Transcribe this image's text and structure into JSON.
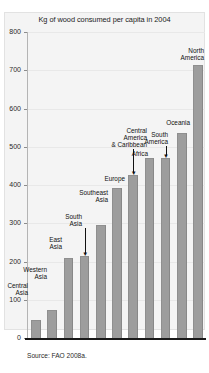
{
  "chart_data": {
    "type": "bar",
    "title": "Kg of wood consumed per capita in 2004",
    "xlabel": "",
    "ylabel": "",
    "ylim": [
      0,
      800
    ],
    "yticks": [
      0,
      100,
      200,
      300,
      400,
      500,
      600,
      700,
      800
    ],
    "grid": true,
    "legend": "none",
    "source": "Source: FAO 2008a.",
    "bar_color": "#9d9d9d",
    "categories": [
      "Central Asia",
      "Western Asia",
      "East Asia",
      "South Asia",
      "Southeast Asia",
      "Europe",
      "Central America & Caribbean",
      "Africa",
      "South America",
      "Oceania",
      "North America"
    ],
    "values": [
      47,
      73,
      210,
      215,
      295,
      392,
      425,
      470,
      470,
      535,
      715
    ]
  },
  "annotations": [
    {
      "text": "Central\nAsia",
      "left": 2,
      "top": 282,
      "width": 26,
      "align": "right",
      "arrow": false
    },
    {
      "text": "Western\nAsia",
      "left": 17,
      "top": 266,
      "width": 30,
      "align": "right",
      "arrow": false
    },
    {
      "text": "East\nAsia",
      "left": 40,
      "top": 236,
      "width": 22,
      "align": "right",
      "arrow": false
    },
    {
      "text": "South\nAsia",
      "left": 56,
      "top": 213,
      "width": 26,
      "align": "right",
      "arrow": true
    },
    {
      "text": "Southeast\nAsia",
      "left": 66,
      "top": 189,
      "width": 42,
      "align": "right",
      "arrow": false
    },
    {
      "text": "Europe",
      "left": 95,
      "top": 175,
      "width": 30,
      "align": "right",
      "arrow": false
    },
    {
      "text": "Central\nAmerica\n& Caribbean",
      "left": 99,
      "top": 127,
      "width": 48,
      "align": "right",
      "arrow": true
    },
    {
      "text": "Africa",
      "left": 124,
      "top": 150,
      "width": 24,
      "align": "right",
      "arrow": false
    },
    {
      "text": "South\nAmerica",
      "left": 139,
      "top": 131,
      "width": 29,
      "align": "right",
      "arrow": true
    },
    {
      "text": "Oceania",
      "left": 157,
      "top": 119,
      "width": 33,
      "align": "right",
      "arrow": false
    },
    {
      "text": "North\nAmerica",
      "left": 172,
      "top": 47,
      "width": 32,
      "align": "right",
      "arrow": false
    }
  ]
}
